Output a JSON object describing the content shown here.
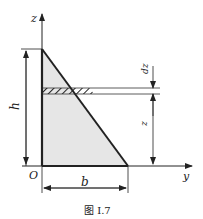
{
  "figure": {
    "caption": "图 I.7",
    "axes": {
      "z_label": "z",
      "y_label": "y",
      "origin_label": "O"
    },
    "dimensions": {
      "height_label": "h",
      "base_label": "b",
      "strip_position_label": "z",
      "strip_thickness_label": "dz"
    },
    "colors": {
      "triangle_fill": "#e6e6e6",
      "stroke": "#222222"
    }
  }
}
